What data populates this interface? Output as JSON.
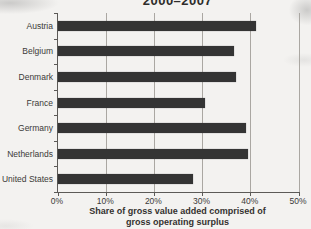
{
  "title": "2000–2007",
  "chart_data": {
    "type": "bar",
    "orientation": "horizontal",
    "title": "2000–2007",
    "categories": [
      "Austria",
      "Belgium",
      "Denmark",
      "France",
      "Germany",
      "Netherlands",
      "United States"
    ],
    "values": [
      41,
      36.5,
      37,
      30.5,
      39,
      39.5,
      28
    ],
    "xlabel": "Share of gross value added comprised of gross operating surplus",
    "xlabel_line1": "Share of gross value added comprised of",
    "xlabel_line2": "gross operating surplus",
    "x_ticks": [
      "0%",
      "10%",
      "20%",
      "30%",
      "40%",
      "50%"
    ],
    "x_tick_values": [
      0,
      10,
      20,
      30,
      40,
      50
    ],
    "xlim": [
      0,
      50
    ],
    "grid": true,
    "legend": "none",
    "bar_color": "#343434",
    "grid_color": "#aaa7a2",
    "axis_color": "#5c5a57"
  }
}
